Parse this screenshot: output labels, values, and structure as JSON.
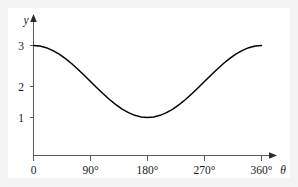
{
  "page": {
    "background_color": "#f3f3f3",
    "panel_color": "#ffffff"
  },
  "chart_data": {
    "type": "line",
    "title": "",
    "subtitle": "",
    "xlabel": "θ",
    "ylabel": "y",
    "function": "y = 2 + cos(θ)",
    "xlim": [
      0,
      360
    ],
    "ylim": [
      0,
      3.35
    ],
    "grid": false,
    "legend": false,
    "legend_position": "none",
    "x_tick_labels": [
      "0",
      "90°",
      "180°",
      "270°",
      "360°"
    ],
    "x_tick_values": [
      0,
      90,
      180,
      270,
      360
    ],
    "y_tick_labels": [
      "1",
      "2",
      "3"
    ],
    "y_tick_values": [
      1,
      2,
      3
    ],
    "series": [
      {
        "name": "y = 2 + cos(θ)",
        "color": "#000000",
        "x": [
          0,
          10,
          20,
          30,
          40,
          50,
          60,
          70,
          80,
          90,
          100,
          110,
          120,
          130,
          140,
          150,
          160,
          170,
          180,
          190,
          200,
          210,
          220,
          230,
          240,
          250,
          260,
          270,
          280,
          290,
          300,
          310,
          320,
          330,
          340,
          350,
          360
        ],
        "values": [
          3.0,
          2.985,
          2.94,
          2.866,
          2.766,
          2.643,
          2.5,
          2.342,
          2.174,
          2.0,
          1.826,
          1.658,
          1.5,
          1.357,
          1.234,
          1.134,
          1.06,
          1.015,
          1.0,
          1.015,
          1.06,
          1.134,
          1.234,
          1.357,
          1.5,
          1.658,
          1.826,
          2.0,
          2.174,
          2.342,
          2.5,
          2.643,
          2.766,
          2.866,
          2.94,
          2.985,
          3.0
        ]
      }
    ],
    "annotations": []
  },
  "axes": {
    "y_axis_label": "y",
    "x_axis_label": "θ",
    "x_arrow": "arrow-right",
    "y_arrow": "arrow-up"
  }
}
